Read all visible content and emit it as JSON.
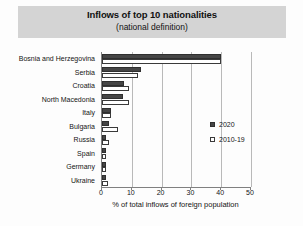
{
  "title": {
    "main": "Inflows of top 10 nationalities",
    "sub": "(national definition)"
  },
  "legend": {
    "position": "right-middle",
    "entries": [
      {
        "label": "2020",
        "swatch": "filled-square-icon",
        "color": "#454545"
      },
      {
        "label": "2010-19",
        "swatch": "hollow-square-icon",
        "color": "#ffffff"
      }
    ]
  },
  "axis": {
    "x_title": "% of total inflows of foreign population",
    "ticks": [
      "0",
      "10",
      "20",
      "30",
      "40",
      "50"
    ]
  },
  "chart_data": {
    "type": "bar",
    "orientation": "horizontal",
    "title": "Inflows of top 10 nationalities (national definition)",
    "xlabel": "% of total inflows of foreign population",
    "ylabel": "",
    "xlim": [
      0,
      50
    ],
    "xticks": [
      0,
      10,
      20,
      30,
      40,
      50
    ],
    "grid": "vertical",
    "legend_position": "right",
    "categories": [
      "Bosnia and Herzegovina",
      "Serbia",
      "Croatia",
      "North Macedonia",
      "Italy",
      "Bulgaria",
      "Russia",
      "Spain",
      "Germany",
      "Ukraine"
    ],
    "series": [
      {
        "name": "2020",
        "color": "#454545",
        "values": [
          40.0,
          13.0,
          7.5,
          7.0,
          3.0,
          2.5,
          1.5,
          1.5,
          1.5,
          1.5
        ]
      },
      {
        "name": "2010-19",
        "color": "#ffffff",
        "values": [
          40.0,
          12.0,
          9.0,
          9.0,
          3.0,
          5.5,
          2.5,
          1.5,
          1.5,
          2.0
        ]
      }
    ]
  }
}
